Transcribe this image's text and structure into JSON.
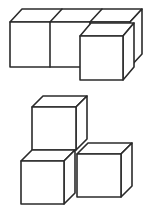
{
  "page": {
    "background": "#ffffff",
    "stroke_color": "#2b2b2b",
    "stroke_width": 1.6,
    "face_fill": "#ffffff",
    "width": 150,
    "height": 212
  },
  "figures": [
    {
      "id": "top-cube-figure",
      "depicts": "row of three cubes drawn in oblique projection with the rightmost cube pulled forward, overlapping the row",
      "shapes": [
        {
          "type": "polygon",
          "part": "row-top-face",
          "points": "10,22 22,9 142,9 130,22"
        },
        {
          "type": "polygon",
          "part": "row-right-face",
          "points": "130,22 142,9 142,54 130,67"
        },
        {
          "type": "polygon",
          "part": "row-front-face",
          "points": "10,22 130,22 130,67 10,67"
        },
        {
          "type": "line",
          "part": "front-division-1",
          "x1": 50,
          "y1": 22,
          "x2": 50,
          "y2": 67
        },
        {
          "type": "line",
          "part": "front-division-2",
          "x1": 90,
          "y1": 22,
          "x2": 90,
          "y2": 67
        },
        {
          "type": "line",
          "part": "top-division-1",
          "x1": 50,
          "y1": 22,
          "x2": 62,
          "y2": 9
        },
        {
          "type": "line",
          "part": "top-division-2",
          "x1": 90,
          "y1": 22,
          "x2": 102,
          "y2": 9
        },
        {
          "type": "polygon",
          "part": "front-cube-top-face",
          "points": "80,36 91,23 134,23 123,36"
        },
        {
          "type": "polygon",
          "part": "front-cube-right-face",
          "points": "123,36 134,23 134,67 123,80"
        },
        {
          "type": "polygon",
          "part": "front-cube-front-face",
          "points": "80,36 123,36 123,80 80,80"
        }
      ]
    },
    {
      "id": "bottom-cube-figure",
      "depicts": "three cubes in an L arrangement: one cube stacked on a lower-left cube, one cube at lower-right",
      "shapes": [
        {
          "type": "polygon",
          "part": "stacked-cube-top-face",
          "points": "32,107 43,96 87,96 76,107"
        },
        {
          "type": "polygon",
          "part": "stacked-cube-right-face",
          "points": "76,107 87,96 87,139 76,150"
        },
        {
          "type": "polygon",
          "part": "stacked-cube-front-face",
          "points": "32,107 76,107 76,150 32,150"
        },
        {
          "type": "polygon",
          "part": "left-cube-top-face",
          "points": "21,161 32,150 75,150 64,161"
        },
        {
          "type": "polygon",
          "part": "left-cube-right-face",
          "points": "64,161 75,150 75,193 64,204"
        },
        {
          "type": "polygon",
          "part": "left-cube-front-face",
          "points": "21,161 64,161 64,204 21,204"
        },
        {
          "type": "polygon",
          "part": "right-cube-top-face",
          "points": "77,154 88,143 132,143 121,154"
        },
        {
          "type": "polygon",
          "part": "right-cube-right-face",
          "points": "121,154 132,143 132,186 121,197"
        },
        {
          "type": "polygon",
          "part": "right-cube-front-face",
          "points": "77,154 121,154 121,197 77,197"
        }
      ]
    }
  ]
}
